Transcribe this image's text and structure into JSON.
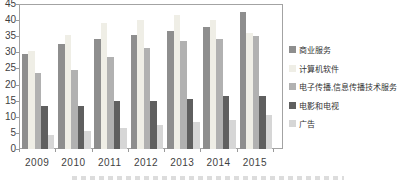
{
  "chart_data": {
    "type": "bar",
    "title": "",
    "categories": [
      "2009",
      "2010",
      "2011",
      "2012",
      "2013",
      "2014",
      "2015"
    ],
    "series": [
      {
        "name": "商业服务",
        "color": "#8e8e8e",
        "values": [
          29.5,
          32.5,
          34,
          35.5,
          36.5,
          38,
          42.5
        ]
      },
      {
        "name": "计算机软件",
        "color": "#efeee6",
        "values": [
          30.5,
          35.5,
          39,
          40,
          41.5,
          40,
          36
        ]
      },
      {
        "name": "电子传播,信息传播技术服务",
        "color": "#b1b1b1",
        "values": [
          23.5,
          24.5,
          28.5,
          31.5,
          33.5,
          34,
          35
        ]
      },
      {
        "name": "电影和电视",
        "color": "#5f5f5f",
        "values": [
          13.5,
          13.5,
          15,
          15,
          15.5,
          16.5,
          16.5
        ]
      },
      {
        "name": "广告",
        "color": "#d6d6d6",
        "values": [
          4.5,
          5.5,
          6.5,
          7.5,
          8.5,
          9,
          10.5
        ]
      }
    ],
    "xlabel": "",
    "ylabel": "",
    "ylim": [
      0,
      45
    ],
    "ytick_interval": 5,
    "yticks": [
      45,
      40,
      35,
      30,
      25,
      20,
      15,
      10,
      5,
      0
    ],
    "grid": false,
    "legend_position": "right",
    "plot_border": true,
    "background_color": "#ffffff"
  }
}
